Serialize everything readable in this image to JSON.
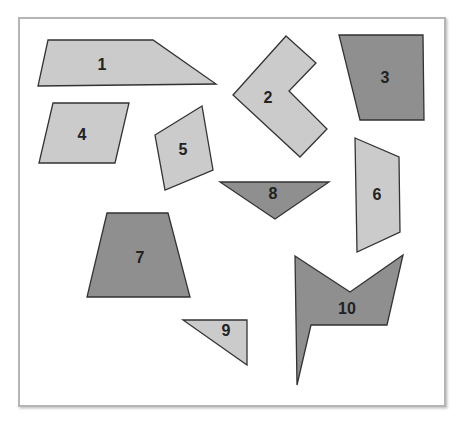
{
  "frame": {
    "x": 19,
    "y": 18,
    "width": 426,
    "height": 388,
    "border_color": "#b5b5b5",
    "fill": "#ffffff"
  },
  "colors": {
    "light": "#cbcbcb",
    "dark": "#8f8f8f",
    "stroke": "#333333"
  },
  "shapes": [
    {
      "id": "1",
      "label": "1",
      "tone": "light",
      "points": "48,40 153,40 216,84 38,86",
      "lx": 102,
      "ly": 66
    },
    {
      "id": "2",
      "label": "2",
      "tone": "light",
      "points": "286,36 316,63 289,91 327,129 300,157 233,95",
      "lx": 268,
      "ly": 99
    },
    {
      "id": "3",
      "label": "3",
      "tone": "dark",
      "points": "339,35 423,35 424,120 360,120",
      "lx": 385,
      "ly": 79
    },
    {
      "id": "4",
      "label": "4",
      "tone": "light",
      "points": "53,103 129,103 115,163 39,163",
      "lx": 82,
      "ly": 136
    },
    {
      "id": "5",
      "label": "5",
      "tone": "light",
      "points": "155,135 202,106 213,170 165,190",
      "lx": 183,
      "ly": 151
    },
    {
      "id": "6",
      "label": "6",
      "tone": "light",
      "points": "355,138 399,157 400,232 357,252",
      "lx": 377,
      "ly": 196
    },
    {
      "id": "7",
      "label": "7",
      "tone": "dark",
      "points": "107,213 168,213 190,297 87,297",
      "lx": 140,
      "ly": 259
    },
    {
      "id": "8",
      "label": "8",
      "tone": "dark",
      "points": "220,182 329,182 275,219",
      "lx": 273,
      "ly": 195
    },
    {
      "id": "9",
      "label": "9",
      "tone": "light",
      "points": "183,320 247,320 247,365",
      "lx": 226,
      "ly": 332
    },
    {
      "id": "10",
      "label": "10",
      "tone": "dark",
      "points": "295,256 350,292 403,255 387,325 311,325 297,385",
      "lx": 347,
      "ly": 310
    }
  ]
}
